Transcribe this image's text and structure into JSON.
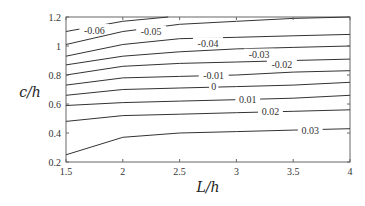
{
  "chart_data": {
    "type": "contour",
    "title": "",
    "xlabel": "L/h",
    "ylabel": "c/h",
    "xlim": [
      1.5,
      4
    ],
    "ylim": [
      0.2,
      1.2
    ],
    "xticks": [
      "1.5",
      "2",
      "2.5",
      "3",
      "3.5",
      "4"
    ],
    "yticks": [
      "0.2",
      "0.4",
      "0.6",
      "0.8",
      "1",
      "1.2"
    ],
    "grid": false,
    "x": [
      1.5,
      2,
      2.5,
      3,
      3.5,
      4
    ],
    "series": [
      {
        "name": "-0.06",
        "label_pos": [
          1.75,
          1.11
        ],
        "points": [
          [
            1.5,
            1.1
          ],
          [
            2,
            1.17
          ],
          [
            2.4,
            1.2
          ]
        ]
      },
      {
        "name": "-0.05",
        "label_pos": [
          2.25,
          1.1
        ],
        "points": [
          [
            1.5,
            1.01
          ],
          [
            2,
            1.1
          ],
          [
            2.5,
            1.15
          ],
          [
            3,
            1.17
          ],
          [
            3.5,
            1.19
          ],
          [
            4,
            1.2
          ]
        ]
      },
      {
        "name": "-0.04",
        "label_pos": [
          2.75,
          1.02
        ],
        "points": [
          [
            1.5,
            0.93
          ],
          [
            2,
            1.01
          ],
          [
            2.5,
            1.05
          ],
          [
            3,
            1.06
          ],
          [
            3.5,
            1.07
          ],
          [
            4,
            1.08
          ]
        ]
      },
      {
        "name": "-0.03",
        "label_pos": [
          3.2,
          0.94
        ],
        "points": [
          [
            1.5,
            0.87
          ],
          [
            2,
            0.93
          ],
          [
            2.5,
            0.96
          ],
          [
            3,
            0.98
          ],
          [
            3.5,
            0.99
          ],
          [
            4,
            1.0
          ]
        ]
      },
      {
        "name": "-0.02",
        "label_pos": [
          3.4,
          0.87
        ],
        "points": [
          [
            1.5,
            0.8
          ],
          [
            2,
            0.86
          ],
          [
            2.5,
            0.88
          ],
          [
            3,
            0.89
          ],
          [
            3.5,
            0.9
          ],
          [
            4,
            0.91
          ]
        ]
      },
      {
        "name": "-0.01",
        "label_pos": [
          2.8,
          0.8
        ],
        "points": [
          [
            1.5,
            0.73
          ],
          [
            2,
            0.78
          ],
          [
            2.5,
            0.79
          ],
          [
            3,
            0.8
          ],
          [
            3.5,
            0.82
          ],
          [
            4,
            0.83
          ]
        ]
      },
      {
        "name": "0",
        "label_pos": [
          2.8,
          0.72
        ],
        "points": [
          [
            1.5,
            0.66
          ],
          [
            2,
            0.7
          ],
          [
            2.5,
            0.71
          ],
          [
            3,
            0.72
          ],
          [
            3.5,
            0.73
          ],
          [
            4,
            0.75
          ]
        ]
      },
      {
        "name": "0.01",
        "label_pos": [
          3.1,
          0.63
        ],
        "points": [
          [
            1.5,
            0.59
          ],
          [
            2,
            0.61
          ],
          [
            2.5,
            0.62
          ],
          [
            3,
            0.63
          ],
          [
            3.5,
            0.64
          ],
          [
            4,
            0.66
          ]
        ]
      },
      {
        "name": "0.02",
        "label_pos": [
          3.3,
          0.55
        ],
        "points": [
          [
            1.5,
            0.48
          ],
          [
            2,
            0.52
          ],
          [
            2.5,
            0.53
          ],
          [
            3,
            0.54
          ],
          [
            3.5,
            0.55
          ],
          [
            4,
            0.56
          ]
        ]
      },
      {
        "name": "0.03",
        "label_pos": [
          3.65,
          0.42
        ],
        "points": [
          [
            1.5,
            0.25
          ],
          [
            2,
            0.37
          ],
          [
            2.5,
            0.4
          ],
          [
            3,
            0.41
          ],
          [
            3.5,
            0.42
          ],
          [
            4,
            0.43
          ]
        ]
      }
    ]
  },
  "colors": {
    "line": "#333333",
    "axis": "#555555",
    "background": "#ffffff"
  }
}
